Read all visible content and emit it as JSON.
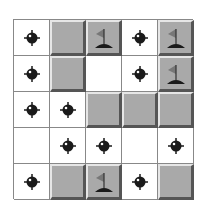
{
  "board": {
    "rows": 5,
    "cols": 5,
    "cells": [
      [
        "mine",
        "hidden",
        "flag",
        "mine",
        "flag"
      ],
      [
        "mine",
        "hidden",
        "empty",
        "mine",
        "flag"
      ],
      [
        "mine",
        "mine",
        "hidden",
        "hidden",
        "hidden"
      ],
      [
        "empty",
        "mine",
        "mine",
        "empty",
        "mine"
      ],
      [
        "mine",
        "hidden",
        "flag",
        "mine",
        "hidden"
      ]
    ]
  },
  "colors": {
    "hidden": "#a9a9a9",
    "mine": "#1a1a1a",
    "flag": "#777777"
  }
}
